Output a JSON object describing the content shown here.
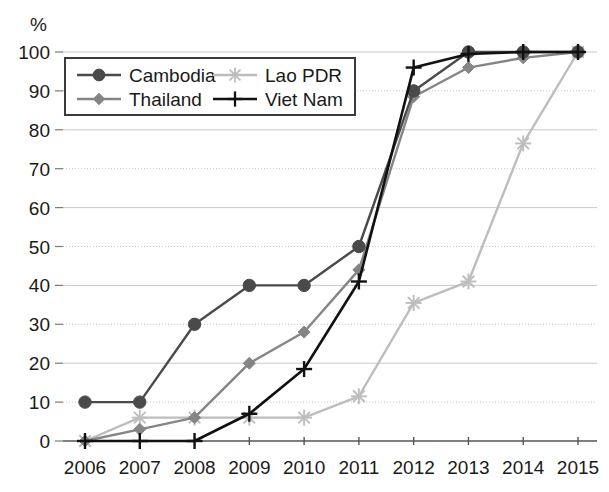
{
  "chart_data": {
    "type": "line",
    "title": "",
    "xlabel": "",
    "ylabel": "%",
    "unit_label": "%",
    "x": [
      2006,
      2007,
      2008,
      2009,
      2010,
      2011,
      2012,
      2013,
      2014,
      2015
    ],
    "categories": [
      "2006",
      "2007",
      "2008",
      "2009",
      "2010",
      "2011",
      "2012",
      "2013",
      "2014",
      "2015"
    ],
    "ylim": [
      0,
      100
    ],
    "yticks": [
      0,
      10,
      20,
      30,
      40,
      50,
      60,
      70,
      80,
      90,
      100
    ],
    "ytick_labels": [
      "0",
      "10",
      "20",
      "30",
      "40",
      "50",
      "60",
      "70",
      "80",
      "90",
      "100"
    ],
    "grid": true,
    "legend_position": "upper-left",
    "series": [
      {
        "name": "Cambodia",
        "color": "#4a4a4a",
        "marker": "circle",
        "values": [
          10,
          10,
          30,
          40,
          40,
          50,
          90,
          100,
          100,
          100
        ]
      },
      {
        "name": "Lao PDR",
        "color": "#bdbdbd",
        "marker": "star",
        "values": [
          0,
          6,
          6,
          6,
          6,
          11.5,
          35.5,
          41,
          76.5,
          100
        ]
      },
      {
        "name": "Thailand",
        "color": "#858585",
        "marker": "diamond",
        "values": [
          0,
          3,
          6,
          20,
          28,
          44,
          88.5,
          96,
          98.5,
          100
        ]
      },
      {
        "name": "Viet Nam",
        "color": "#111111",
        "marker": "plus",
        "values": [
          0,
          0,
          0,
          7,
          18.5,
          41,
          96,
          99.5,
          100,
          100
        ]
      }
    ]
  },
  "legend": {
    "entries": [
      {
        "label": "Cambodia"
      },
      {
        "label": "Lao PDR"
      },
      {
        "label": "Thailand"
      },
      {
        "label": "Viet Nam"
      }
    ]
  }
}
